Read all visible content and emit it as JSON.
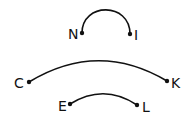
{
  "diagram": {
    "nodes": [
      {
        "id": "N",
        "label": "N",
        "x": 82,
        "y": 33
      },
      {
        "id": "I",
        "label": "I",
        "x": 130,
        "y": 34
      },
      {
        "id": "C",
        "label": "C",
        "x": 29,
        "y": 82
      },
      {
        "id": "K",
        "label": "K",
        "x": 167,
        "y": 81
      },
      {
        "id": "E",
        "label": "E",
        "x": 70,
        "y": 104
      },
      {
        "id": "L",
        "label": "L",
        "x": 137,
        "y": 105
      }
    ],
    "arcs": [
      {
        "from": "N",
        "to": "I"
      },
      {
        "from": "C",
        "to": "K"
      },
      {
        "from": "E",
        "to": "L"
      }
    ],
    "colors": {
      "stroke": "#111111",
      "background": "#ffffff"
    }
  }
}
